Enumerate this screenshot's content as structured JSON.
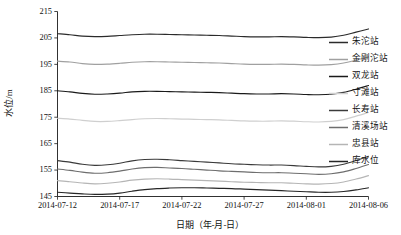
{
  "chart_data": {
    "type": "line",
    "title": "",
    "xlabel": "日期（年-月-日）",
    "ylabel": "水位/m",
    "grid": false,
    "legend_position": "right",
    "ylim": [
      145,
      215
    ],
    "yticks": [
      145,
      155,
      165,
      175,
      185,
      195,
      205,
      215
    ],
    "xlim": [
      "2014-07-12",
      "2014-08-06"
    ],
    "xticks": [
      "2014-07-12",
      "2014-07-17",
      "2014-07-22",
      "2014-07-27",
      "2014-08-01",
      "2014-08-06"
    ],
    "x": [
      "2014-07-12",
      "2014-07-13",
      "2014-07-14",
      "2014-07-15",
      "2014-07-16",
      "2014-07-17",
      "2014-07-18",
      "2014-07-19",
      "2014-07-20",
      "2014-07-21",
      "2014-07-22",
      "2014-07-23",
      "2014-07-24",
      "2014-07-25",
      "2014-07-26",
      "2014-07-27",
      "2014-07-28",
      "2014-07-29",
      "2014-07-30",
      "2014-07-31",
      "2014-08-01",
      "2014-08-02",
      "2014-08-03",
      "2014-08-04",
      "2014-08-05",
      "2014-08-06"
    ],
    "series": [
      {
        "name": "朱沱站",
        "color": "#2b2b2b",
        "values": [
          206.6,
          206.2,
          205.7,
          205.5,
          205.6,
          205.9,
          206.2,
          206.4,
          206.4,
          206.3,
          206.2,
          206.1,
          206.0,
          205.9,
          205.7,
          205.5,
          205.4,
          205.4,
          205.5,
          205.4,
          205.2,
          205.1,
          205.3,
          206.0,
          207.2,
          208.4
        ]
      },
      {
        "name": "金刚沱站",
        "color": "#a0a0a0",
        "values": [
          196.2,
          195.9,
          195.3,
          195.0,
          195.1,
          195.4,
          195.8,
          196.0,
          196.0,
          195.9,
          195.8,
          195.7,
          195.6,
          195.5,
          195.3,
          195.1,
          195.0,
          195.0,
          195.1,
          195.0,
          194.8,
          194.7,
          194.9,
          195.5,
          196.6,
          197.8
        ]
      },
      {
        "name": "双龙站",
        "color": "#1a1a1a",
        "values": [
          185.0,
          184.6,
          184.0,
          183.7,
          183.8,
          184.1,
          184.6,
          184.8,
          184.8,
          184.7,
          184.6,
          184.5,
          184.4,
          184.3,
          184.1,
          183.9,
          183.8,
          183.8,
          183.9,
          183.8,
          183.6,
          183.5,
          183.7,
          184.4,
          185.6,
          187.0
        ]
      },
      {
        "name": "寸滩站",
        "color": "#cfcfcf",
        "values": [
          174.6,
          174.3,
          173.8,
          173.4,
          173.4,
          173.7,
          174.1,
          174.4,
          174.5,
          174.4,
          174.3,
          174.2,
          174.1,
          174.0,
          173.8,
          173.6,
          173.5,
          173.5,
          173.6,
          173.5,
          173.3,
          173.2,
          173.4,
          174.1,
          175.4,
          176.8
        ]
      },
      {
        "name": "长寿站",
        "color": "#3a3a3a",
        "values": [
          158.6,
          158.0,
          157.2,
          156.8,
          157.0,
          157.6,
          158.5,
          159.0,
          159.1,
          158.9,
          158.6,
          158.3,
          158.0,
          157.7,
          157.4,
          157.2,
          157.0,
          156.9,
          156.9,
          156.7,
          156.4,
          156.2,
          156.4,
          157.2,
          158.6,
          160.2
        ]
      },
      {
        "name": "清溪场站",
        "color": "#6e6e6e",
        "values": [
          155.4,
          154.9,
          154.2,
          153.8,
          154.0,
          154.6,
          155.4,
          155.9,
          156.0,
          155.8,
          155.6,
          155.3,
          155.0,
          154.7,
          154.5,
          154.3,
          154.1,
          154.0,
          154.0,
          153.8,
          153.6,
          153.4,
          153.6,
          154.3,
          155.6,
          157.1
        ]
      },
      {
        "name": "忠县站",
        "color": "#b5b5b5",
        "values": [
          151.0,
          150.6,
          150.1,
          149.8,
          150.0,
          150.5,
          151.2,
          151.6,
          151.7,
          151.6,
          151.4,
          151.2,
          151.0,
          150.8,
          150.6,
          150.4,
          150.3,
          150.2,
          150.2,
          150.0,
          149.8,
          149.7,
          149.9,
          150.5,
          151.6,
          152.9
        ]
      },
      {
        "name": "库水位",
        "color": "#262626",
        "values": [
          146.6,
          146.3,
          146.0,
          145.8,
          145.9,
          146.3,
          147.0,
          147.6,
          148.0,
          148.2,
          148.3,
          148.3,
          148.2,
          148.1,
          148.0,
          147.8,
          147.6,
          147.4,
          147.2,
          147.0,
          146.8,
          146.6,
          146.6,
          146.9,
          147.5,
          148.3
        ]
      }
    ]
  }
}
